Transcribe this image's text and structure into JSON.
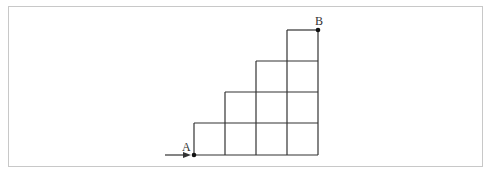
{
  "diagram": {
    "type": "staircase-grid",
    "points": {
      "A": {
        "label": "A",
        "col": 0,
        "row": 0
      },
      "B": {
        "label": "B",
        "col": 4,
        "row": 4
      }
    },
    "grid": {
      "columns": 4,
      "rows": 4,
      "column_heights": [
        1,
        2,
        3,
        4
      ],
      "description": "Staircase of unit squares; column i (from left) has i+1 squares"
    },
    "arrow": {
      "direction": "right",
      "points_to": "A"
    },
    "colors": {
      "line": "#333333",
      "frame": "#c8c8c8"
    }
  }
}
